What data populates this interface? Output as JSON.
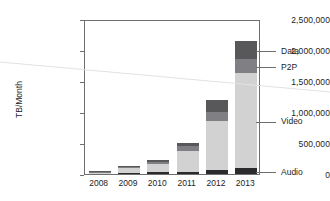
{
  "chart_data": {
    "type": "bar",
    "title": "",
    "subtitle": "",
    "xlabel": "",
    "ylabel": "TB/Month",
    "categories": [
      "2008",
      "2009",
      "2010",
      "2011",
      "2012",
      "2013"
    ],
    "ylim": [
      0,
      2500000
    ],
    "ytick_labels": [
      "0",
      "500,000",
      "1,000,000",
      "1,500,000",
      "2,000,000",
      "2,500,000"
    ],
    "ytick_values": [
      0,
      500000,
      1000000,
      1500000,
      2000000,
      2500000
    ],
    "grid": false,
    "stacked": true,
    "legend_position": "right-callouts",
    "series": [
      {
        "name": "Audio",
        "color": "#2b2b2d",
        "values": [
          8000,
          15000,
          25000,
          40000,
          60000,
          95000
        ]
      },
      {
        "name": "Video",
        "color": "#d2d2d2",
        "values": [
          18000,
          75000,
          140000,
          330000,
          790000,
          1530000
        ]
      },
      {
        "name": "P2P",
        "color": "#808084",
        "values": [
          8000,
          25000,
          35000,
          75000,
          145000,
          225000
        ]
      },
      {
        "name": "Data",
        "color": "#58585a",
        "values": [
          6000,
          15000,
          30000,
          55000,
          205000,
          300000
        ]
      }
    ],
    "totals": [
      40000,
      130000,
      230000,
      500000,
      1200000,
      2150000
    ]
  },
  "legend": {
    "entries": [
      {
        "label": "Data",
        "series": "Data"
      },
      {
        "label": "P2P",
        "series": "P2P"
      },
      {
        "label": "Video",
        "series": "Video"
      },
      {
        "label": "Audio",
        "series": "Audio"
      }
    ]
  },
  "axis": {
    "y_title": "TB/Month"
  }
}
